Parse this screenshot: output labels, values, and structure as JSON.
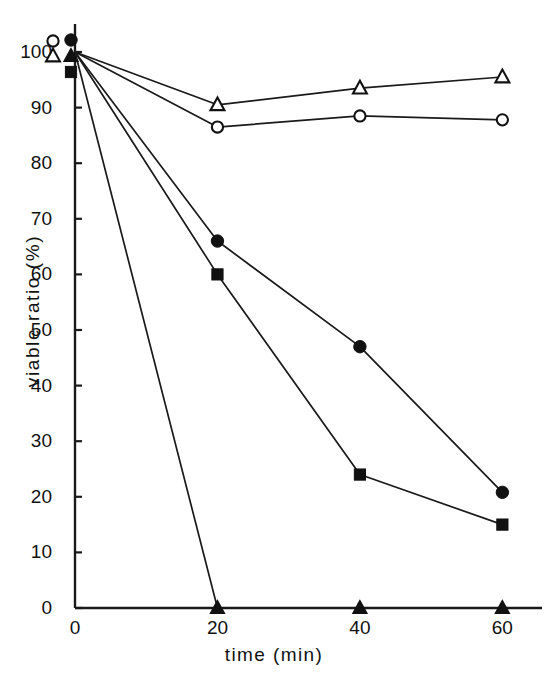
{
  "chart_data": {
    "type": "line",
    "title": "",
    "xlabel": "time (min)",
    "ylabel": "viable ratio (%)",
    "x": [
      0,
      20,
      40,
      60
    ],
    "xlim": [
      0,
      65
    ],
    "ylim": [
      0,
      104
    ],
    "xticks": [
      "0",
      "20",
      "40",
      "60"
    ],
    "xtick_values": [
      0,
      20,
      40,
      60
    ],
    "yticks": [
      "0",
      "10",
      "20",
      "30",
      "40",
      "50",
      "60",
      "70",
      "80",
      "90",
      "100"
    ],
    "ytick_values": [
      0,
      10,
      20,
      30,
      40,
      50,
      60,
      70,
      80,
      90,
      100
    ],
    "grid": false,
    "legend": "none",
    "series": [
      {
        "name": "open-triangle",
        "marker": "triangle-open",
        "values": [
          100,
          90.5,
          93.5,
          95.5
        ]
      },
      {
        "name": "open-circle",
        "marker": "circle-open",
        "values": [
          100,
          86.5,
          88.5,
          87.8
        ]
      },
      {
        "name": "filled-circle",
        "marker": "circle-filled",
        "values": [
          100,
          66,
          47,
          20.8
        ]
      },
      {
        "name": "filled-square",
        "marker": "square-filled",
        "values": [
          100,
          60,
          24,
          15
        ]
      },
      {
        "name": "filled-triangle",
        "marker": "triangle-filled",
        "values": [
          100,
          0,
          0,
          0
        ]
      }
    ],
    "marker_key_at_origin": [
      "circle-open",
      "circle-filled",
      "triangle-open",
      "triangle-filled",
      "square-filled"
    ],
    "line_color": "#1a1a1a",
    "marker_color": "#111111",
    "axis_color": "#1a1a1a",
    "background": "#ffffff"
  },
  "axes": {
    "y_label_text": "viable ratio (%)",
    "x_label_text": "time (min)"
  }
}
